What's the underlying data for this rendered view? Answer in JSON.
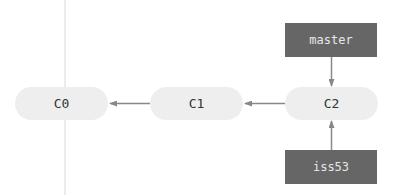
{
  "diagram": {
    "type": "git-branch-graph",
    "commits": [
      {
        "id": "c0",
        "label": "C0"
      },
      {
        "id": "c1",
        "label": "C1"
      },
      {
        "id": "c2",
        "label": "C2"
      }
    ],
    "branches": [
      {
        "id": "master",
        "label": "master",
        "points_to": "C2"
      },
      {
        "id": "iss53",
        "label": "iss53",
        "points_to": "C2"
      }
    ],
    "edges": [
      {
        "from": "C1",
        "to": "C0"
      },
      {
        "from": "C2",
        "to": "C1"
      },
      {
        "from": "master",
        "to": "C2"
      },
      {
        "from": "iss53",
        "to": "C2"
      }
    ],
    "colors": {
      "commit_fill": "#eeeeee",
      "commit_text": "#333333",
      "branch_fill": "#666666",
      "branch_text": "#e8e8e8",
      "arrow": "#888888"
    }
  }
}
